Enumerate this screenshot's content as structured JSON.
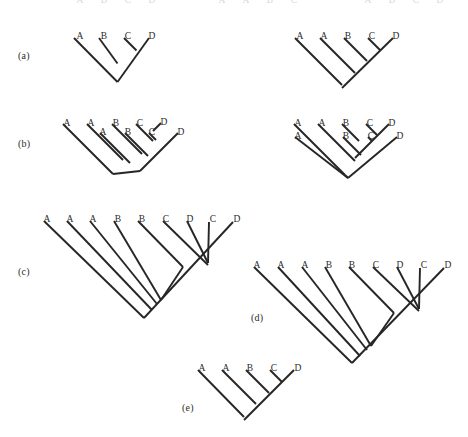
{
  "figure": {
    "title": "",
    "background_color": "#ffffff",
    "line_color": "#262626",
    "text_color": "#2b2b2b",
    "width": 468,
    "height": 437
  },
  "panels": [
    {
      "id": "a",
      "label": "(a)",
      "label_x": 18,
      "label_y": 50,
      "trees": [
        {
          "id": "a-left",
          "name": "tree-a-left",
          "tips": [
            {
              "label": "A",
              "lx": 80,
              "ly": 31,
              "x": 74,
              "y": 38
            },
            {
              "label": "B",
              "lx": 104,
              "ly": 31,
              "x": 99,
              "y": 38
            },
            {
              "label": "C",
              "lx": 128,
              "ly": 31,
              "x": 124,
              "y": 38
            },
            {
              "label": "D",
              "lx": 152,
              "ly": 31,
              "x": 149,
              "y": 38
            }
          ],
          "nodes": [
            {
              "x": 136.5,
              "y": 63
            },
            {
              "x": 117.5,
              "y": 82
            }
          ],
          "edges": [
            [
              74,
              38,
              117.5,
              82
            ],
            [
              99,
              38,
              117.5,
              63.5
            ],
            [
              124,
              38,
              136.5,
              50.5
            ],
            [
              149,
              38,
              117.5,
              82
            ]
          ]
        },
        {
          "id": "a-right",
          "name": "tree-a-right",
          "tips": [
            {
              "label": "A",
              "lx": 300,
              "ly": 31,
              "x": 295,
              "y": 38
            },
            {
              "label": "A",
              "lx": 324,
              "ly": 31,
              "x": 320,
              "y": 38
            },
            {
              "label": "B",
              "lx": 348,
              "ly": 31,
              "x": 344,
              "y": 38
            },
            {
              "label": "C",
              "lx": 372,
              "ly": 31,
              "x": 368,
              "y": 38
            },
            {
              "label": "D",
              "lx": 396,
              "ly": 31,
              "x": 393,
              "y": 38
            }
          ],
          "nodes": [],
          "edges": [
            [
              295,
              38,
              342,
              85
            ],
            [
              320,
              38,
              355,
              73
            ],
            [
              344,
              38,
              367,
              61
            ],
            [
              368,
              38,
              380.5,
              50.5
            ],
            [
              393,
              38,
              342,
              88
            ]
          ]
        }
      ]
    },
    {
      "id": "b",
      "label": "(b)",
      "label_x": 18,
      "label_y": 138,
      "trees": [
        {
          "id": "b-left",
          "name": "tree-b-left",
          "tips": [
            {
              "label": "A",
              "lx": 67,
              "ly": 118,
              "x": 63,
              "y": 124
            },
            {
              "label": "A",
              "lx": 91,
              "ly": 118,
              "x": 87,
              "y": 124
            },
            {
              "label": "A",
              "lx": 103,
              "ly": 127,
              "x": 100,
              "y": 133
            },
            {
              "label": "B",
              "lx": 116,
              "ly": 118,
              "x": 112,
              "y": 124
            },
            {
              "label": "B",
              "lx": 128,
              "ly": 127,
              "x": 125,
              "y": 133
            },
            {
              "label": "C",
              "lx": 140,
              "ly": 118,
              "x": 136,
              "y": 124
            },
            {
              "label": "C",
              "lx": 152,
              "ly": 127,
              "x": 149,
              "y": 133
            },
            {
              "label": "D",
              "lx": 164,
              "ly": 117,
              "x": 161,
              "y": 123
            },
            {
              "label": "D",
              "lx": 181,
              "ly": 127,
              "x": 178,
              "y": 133
            }
          ],
          "nodes": [],
          "edges": [
            [
              63,
              124,
              113,
              174
            ],
            [
              87,
              124,
              123,
              160
            ],
            [
              100,
              133,
              130,
              163
            ],
            [
              112,
              124,
              142,
              154
            ],
            [
              125,
              133,
              148,
              156
            ],
            [
              136,
              124,
              153,
              141
            ],
            [
              149,
              133,
              156,
              140
            ],
            [
              161,
              123,
              153,
              131
            ],
            [
              178,
              133,
              140,
              171
            ],
            [
              113,
              174,
              140,
              171
            ]
          ]
        },
        {
          "id": "b-right",
          "name": "tree-b-right",
          "tips": [
            {
              "label": "A",
              "lx": 298,
              "ly": 118,
              "x": 294,
              "y": 124
            },
            {
              "label": "A",
              "lx": 298,
              "ly": 131,
              "x": 295,
              "y": 137
            },
            {
              "label": "A",
              "lx": 322,
              "ly": 118,
              "x": 318,
              "y": 124
            },
            {
              "label": "B",
              "lx": 346,
              "ly": 118,
              "x": 342,
              "y": 124
            },
            {
              "label": "B",
              "lx": 346,
              "ly": 131,
              "x": 343,
              "y": 137
            },
            {
              "label": "C",
              "lx": 370,
              "ly": 118,
              "x": 366,
              "y": 124
            },
            {
              "label": "C",
              "lx": 371,
              "ly": 131,
              "x": 368,
              "y": 137
            },
            {
              "label": "D",
              "lx": 392,
              "ly": 118,
              "x": 389,
              "y": 124
            },
            {
              "label": "D",
              "lx": 400,
              "ly": 131,
              "x": 397,
              "y": 137
            }
          ],
          "nodes": [],
          "edges": [
            [
              294,
              124,
              345,
              175
            ],
            [
              295,
              137,
              348,
              178
            ],
            [
              318,
              124,
              355,
              161
            ],
            [
              342,
              124,
              359,
              141
            ],
            [
              343,
              137,
              361,
              155
            ],
            [
              366,
              124,
              377,
              135
            ],
            [
              368,
              137,
              372,
              141
            ],
            [
              389,
              124,
              355,
              158
            ],
            [
              397,
              137,
              348,
              178
            ],
            [
              345,
              175,
              348,
              178
            ]
          ]
        }
      ]
    },
    {
      "id": "c",
      "label": "(c)",
      "label_x": 18,
      "label_y": 266,
      "trees": [
        {
          "id": "c-main",
          "name": "tree-c",
          "tips": [
            {
              "label": "A",
              "lx": 47,
              "ly": 214,
              "x": 44,
              "y": 221
            },
            {
              "label": "A",
              "lx": 70,
              "ly": 214,
              "x": 67,
              "y": 221
            },
            {
              "label": "A",
              "lx": 93,
              "ly": 214,
              "x": 90,
              "y": 221
            },
            {
              "label": "B",
              "lx": 118,
              "ly": 214,
              "x": 114,
              "y": 221
            },
            {
              "label": "B",
              "lx": 142,
              "ly": 214,
              "x": 138,
              "y": 221
            },
            {
              "label": "C",
              "lx": 166,
              "ly": 214,
              "x": 163,
              "y": 221
            },
            {
              "label": "D",
              "lx": 190,
              "ly": 214,
              "x": 187,
              "y": 221
            },
            {
              "label": "C",
              "lx": 213,
              "ly": 214,
              "x": 209,
              "y": 222
            },
            {
              "label": "D",
              "lx": 237,
              "ly": 214,
              "x": 233,
              "y": 222
            }
          ],
          "nodes": [],
          "edges": [
            [
              44,
              221,
              144,
              318
            ],
            [
              67,
              221,
              152,
              310
            ],
            [
              90,
              221,
              157,
              304
            ],
            [
              114,
              221,
              161,
              300
            ],
            [
              138,
              221,
              183,
              267
            ],
            [
              163,
              221,
              208,
              265
            ],
            [
              187,
              221,
              208,
              263
            ],
            [
              209,
              222,
              208,
              263
            ],
            [
              233,
              222,
              144,
              318
            ],
            [
              161,
              300,
              183,
              267
            ]
          ]
        }
      ]
    },
    {
      "id": "d",
      "label": "(d)",
      "label_x": 251,
      "label_y": 312,
      "trees": [
        {
          "id": "d-main",
          "name": "tree-d",
          "tips": [
            {
              "label": "A",
              "lx": 257,
              "ly": 260,
              "x": 254,
              "y": 267
            },
            {
              "label": "A",
              "lx": 281,
              "ly": 260,
              "x": 278,
              "y": 267
            },
            {
              "label": "A",
              "lx": 305,
              "ly": 260,
              "x": 302,
              "y": 267
            },
            {
              "label": "B",
              "lx": 329,
              "ly": 260,
              "x": 325,
              "y": 267
            },
            {
              "label": "B",
              "lx": 352,
              "ly": 260,
              "x": 349,
              "y": 267
            },
            {
              "label": "C",
              "lx": 376,
              "ly": 260,
              "x": 373,
              "y": 267
            },
            {
              "label": "D",
              "lx": 400,
              "ly": 260,
              "x": 397,
              "y": 267
            },
            {
              "label": "C",
              "lx": 424,
              "ly": 260,
              "x": 420,
              "y": 268
            },
            {
              "label": "D",
              "lx": 448,
              "ly": 260,
              "x": 444,
              "y": 268
            }
          ],
          "nodes": [],
          "edges": [
            [
              254,
              267,
              352,
              363
            ],
            [
              278,
              267,
              360,
              356
            ],
            [
              302,
              267,
              367,
              350
            ],
            [
              325,
              267,
              371,
              346
            ],
            [
              349,
              267,
              394,
              313
            ],
            [
              373,
              267,
              419,
              311
            ],
            [
              397,
              267,
              419,
              309
            ],
            [
              420,
              268,
              419,
              309
            ],
            [
              444,
              268,
              352,
              363
            ],
            [
              371,
              346,
              394,
              313
            ]
          ]
        }
      ]
    },
    {
      "id": "e",
      "label": "(e)",
      "label_x": 182,
      "label_y": 402,
      "trees": [
        {
          "id": "e-main",
          "name": "tree-e",
          "tips": [
            {
              "label": "A",
              "lx": 202,
              "ly": 363,
              "x": 198,
              "y": 370
            },
            {
              "label": "A",
              "lx": 226,
              "ly": 363,
              "x": 222,
              "y": 370
            },
            {
              "label": "B",
              "lx": 250,
              "ly": 363,
              "x": 246,
              "y": 370
            },
            {
              "label": "C",
              "lx": 274,
              "ly": 363,
              "x": 270,
              "y": 370
            },
            {
              "label": "D",
              "lx": 298,
              "ly": 363,
              "x": 294,
              "y": 370
            }
          ],
          "nodes": [],
          "edges": [
            [
              198,
              370,
              244,
              417
            ],
            [
              222,
              370,
              256,
              404
            ],
            [
              246,
              370,
              269,
              393
            ],
            [
              270,
              370,
              282,
              382
            ],
            [
              294,
              370,
              244,
              420
            ]
          ]
        }
      ]
    }
  ],
  "cropped_top_row": {
    "description": "partially cropped taxon labels at the very top edge of the page",
    "labels": [
      {
        "label": "A",
        "lx": 80
      },
      {
        "label": "B",
        "lx": 104
      },
      {
        "label": "C",
        "lx": 128
      },
      {
        "label": "D",
        "lx": 152
      },
      {
        "label": "A",
        "lx": 222
      },
      {
        "label": "A",
        "lx": 246
      },
      {
        "label": "B",
        "lx": 270
      },
      {
        "label": "C",
        "lx": 294
      },
      {
        "label": "A",
        "lx": 368
      },
      {
        "label": "B",
        "lx": 392
      },
      {
        "label": "C",
        "lx": 416
      },
      {
        "label": "D",
        "lx": 440
      }
    ]
  }
}
